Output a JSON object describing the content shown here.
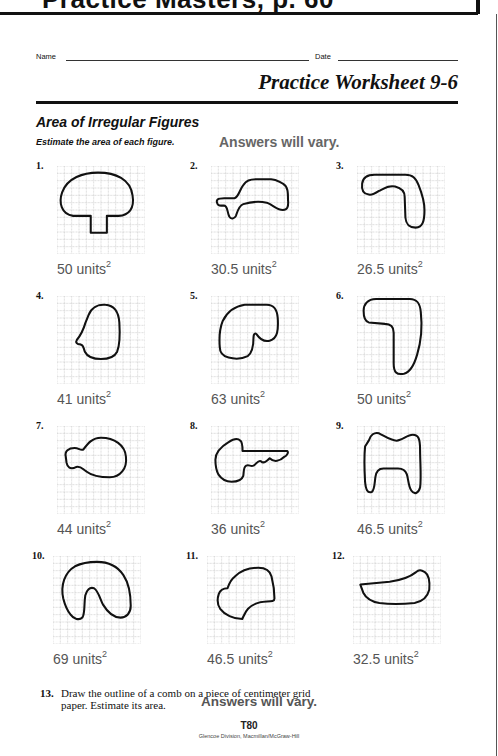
{
  "banner": {
    "title": "Practice Masters, p. 60"
  },
  "header": {
    "name_label": "Name",
    "date_label": "Date",
    "worksheet_title": "Practice Worksheet 9-6"
  },
  "section": {
    "title": "Area of Irregular Figures",
    "instructions": "Estimate the area of each figure.",
    "answer_note": "Answers will vary."
  },
  "grid": {
    "cols": 12,
    "rows": 12,
    "line_color": "#9a9a9a",
    "shape_stroke": "#111111"
  },
  "problems": [
    {
      "number": "1.",
      "answer": "50 units",
      "exp": "2",
      "shape": "mushroom"
    },
    {
      "number": "2.",
      "answer": "30.5 units",
      "exp": "2",
      "shape": "blob"
    },
    {
      "number": "3.",
      "answer": "26.5 units",
      "exp": "2",
      "shape": "hook"
    },
    {
      "number": "4.",
      "answer": "41 units",
      "exp": "2",
      "shape": "head-profile"
    },
    {
      "number": "5.",
      "answer": "63 units",
      "exp": "2",
      "shape": "kidney"
    },
    {
      "number": "6.",
      "answer": "50 units",
      "exp": "2",
      "shape": "number-seven"
    },
    {
      "number": "7.",
      "answer": "44 units",
      "exp": "2",
      "shape": "balloon"
    },
    {
      "number": "8.",
      "answer": "36 units",
      "exp": "2",
      "shape": "key"
    },
    {
      "number": "9.",
      "answer": "46.5 units",
      "exp": "2",
      "shape": "tooth"
    },
    {
      "number": "10.",
      "answer": "69 units",
      "exp": "2",
      "shape": "arch"
    },
    {
      "number": "11.",
      "answer": "46.5 units",
      "exp": "2",
      "shape": "irregular-blob"
    },
    {
      "number": "12.",
      "answer": "32.5 units",
      "exp": "2",
      "shape": "canoe"
    }
  ],
  "question13": {
    "number": "13.",
    "line1": "Draw the outline of a comb on a piece of centimeter grid",
    "line2": "paper. Estimate its area.",
    "answer": "Answers will vary."
  },
  "footer": {
    "page": "T80",
    "credit": "Glencoe Division, Macmillan/McGraw-Hill"
  }
}
